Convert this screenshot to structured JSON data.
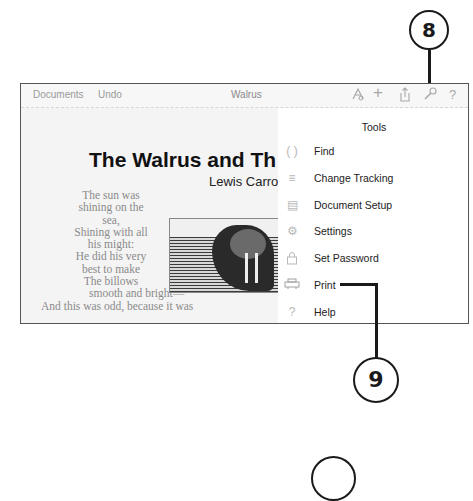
{
  "toolbar": {
    "documents_label": "Documents",
    "undo_label": "Undo",
    "doc_title": "Walrus",
    "icons": {
      "format": "A",
      "add": "+",
      "share": "⇧",
      "tools": "🔧",
      "help": "?"
    }
  },
  "document": {
    "title": "The Walrus and Th",
    "author": "Lewis Carro",
    "poem_lines": [
      "The sun was",
      "shining on the",
      "sea,",
      "Shining with all",
      "his might:",
      "He did his very",
      "best to make",
      "The billows"
    ],
    "poem_wide_line": "smooth and bright—",
    "poem_clipped_line": "And this was odd, because it was"
  },
  "tools_popover": {
    "title": "Tools",
    "items": [
      {
        "label": "Find",
        "icon": "find-icon",
        "glyph": "( )"
      },
      {
        "label": "Change Tracking",
        "icon": "change-tracking-icon",
        "glyph": "≡"
      },
      {
        "label": "Document Setup",
        "icon": "document-setup-icon",
        "glyph": "▤"
      },
      {
        "label": "Settings",
        "icon": "settings-icon",
        "glyph": "⚙"
      },
      {
        "label": "Set Password",
        "icon": "lock-icon",
        "glyph": "🔒"
      },
      {
        "label": "Print",
        "icon": "printer-icon",
        "glyph": "⎙"
      },
      {
        "label": "Help",
        "icon": "help-icon",
        "glyph": "?"
      }
    ]
  },
  "callouts": [
    {
      "number": "8",
      "target": "tools-button"
    },
    {
      "number": "9",
      "target": "print-menu-item"
    },
    {
      "number": "",
      "target": ""
    }
  ]
}
